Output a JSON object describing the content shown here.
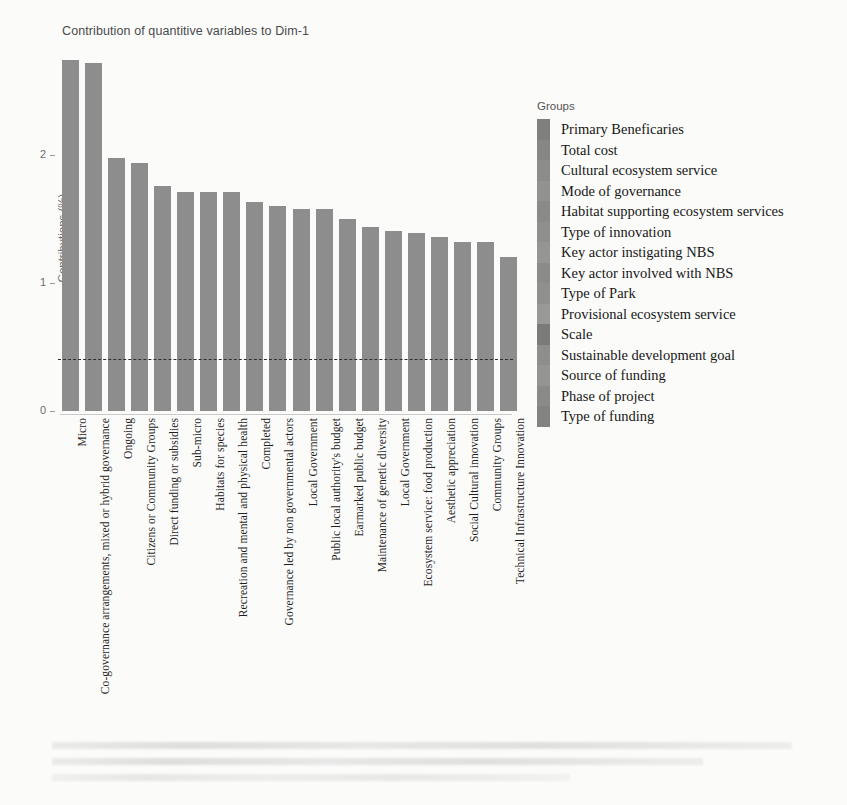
{
  "chart_data": {
    "type": "bar",
    "title": "Contribution of quantitive variables to Dim-1",
    "xlabel": "",
    "ylabel": "Contributions (%)",
    "ylim": [
      0,
      2.85
    ],
    "yticks": [
      0,
      1,
      2
    ],
    "ytick_labels": [
      "0",
      "1",
      "2"
    ],
    "grid": false,
    "reference_line": {
      "value": 0.4,
      "style": "dashed",
      "color": "#2f2f2f"
    },
    "bar_color": "#8d8d8d",
    "legend": {
      "position": "right",
      "title": "Groups"
    },
    "categories": [
      "Micro",
      "Co-governance arrangements, mixed or hybrid governance",
      "Ongoing",
      "Citizens or Community Groups",
      "Direct funding or subsidies",
      "Sub-micro",
      "Habitats for species",
      "Recreation and mental and physical health",
      "Completed",
      "Governance led by non governmental actors",
      "Local Government",
      "Public local authority's budget",
      "Earmarked public budget",
      "Maintenance of genetic diversity",
      "Local Government",
      "Ecosystem service: food production",
      "Aesthetic appreciation",
      "Social Cultural innovation",
      "Community Groups",
      "Technical Infrastructure Innovation"
    ],
    "values": [
      2.74,
      2.72,
      1.98,
      1.94,
      1.76,
      1.71,
      1.71,
      1.71,
      1.63,
      1.6,
      1.58,
      1.58,
      1.5,
      1.44,
      1.41,
      1.39,
      1.36,
      1.32,
      1.32,
      1.2
    ]
  },
  "legend_items": [
    "Primary  Beneficaries",
    "Total cost",
    "Cultural ecosystem service",
    "Mode of governance",
    "Habitat supporting ecosystem services",
    "Type of innovation",
    "Key actor instigating NBS",
    "Key actor involved with NBS",
    "Type of Park",
    "Provisional ecosystem service",
    "Scale",
    "Sustainable development goal",
    "Source of funding",
    "Phase of project",
    "Type of funding"
  ],
  "legend_colors": [
    "#7f7f7f",
    "#868686",
    "#8c8c8c",
    "#929292",
    "#8a8a8a",
    "#8f8f8f",
    "#959595",
    "#8b8b8b",
    "#909090",
    "#999999",
    "#7b7b7b",
    "#8e8e8e",
    "#949494",
    "#8a8a8a",
    "#838383"
  ]
}
